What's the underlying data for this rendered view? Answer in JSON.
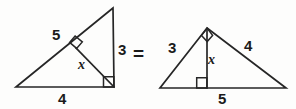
{
  "figure": {
    "stroke_color": "#262626",
    "background_color": "#fdfdfc",
    "text_color": "#1b1b1b",
    "equals_symbol": "=",
    "left_triangle": {
      "name": "left-triangle",
      "description": "Right triangle with vertical right leg, altitude drawn from right-angle vertex to hypotenuse",
      "labels": {
        "hypotenuse": "5",
        "vertical_leg": "3",
        "altitude": "x",
        "base": "4"
      },
      "vertices": {
        "apex": [
          113,
          8
        ],
        "bottom_left": [
          16,
          87
        ],
        "bottom_right": [
          114,
          87
        ]
      },
      "altitude_foot": [
        76,
        48
      ],
      "right_angle_marks": [
        "at-bottom-right-vertex",
        "at-altitude-foot-on-hypotenuse"
      ]
    },
    "right_triangle": {
      "name": "right-triangle",
      "description": "Right triangle resting on its hypotenuse with altitude dropped from the apex right angle to the base",
      "labels": {
        "left_leg": "3",
        "right_leg": "4",
        "altitude": "x",
        "base": "5"
      },
      "vertices": {
        "apex": [
          207,
          28
        ],
        "bottom_left": [
          160,
          88
        ],
        "bottom_right": [
          286,
          88
        ]
      },
      "altitude_foot": [
        207,
        88
      ],
      "right_angle_marks": [
        "at-apex",
        "at-altitude-foot-on-base"
      ]
    }
  }
}
